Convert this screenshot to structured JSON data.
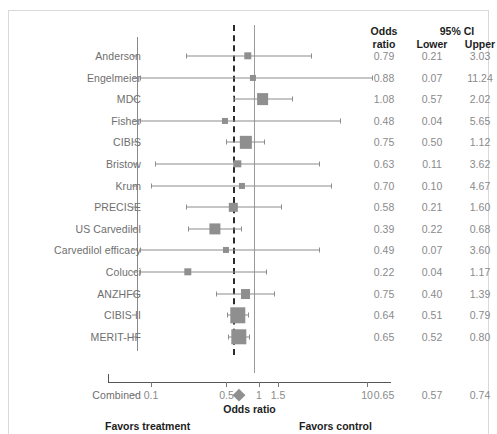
{
  "top_clipped_text": "",
  "table_headers": {
    "odds_ratio": "Odds\nratio",
    "or_line1": "Odds",
    "or_line2": "ratio",
    "ci_group": "95% CI",
    "lower": "Lower",
    "upper": "Upper"
  },
  "axis": {
    "title": "Odds ratio",
    "favors_left": "Favors treatment",
    "favors_right": "Favors control",
    "ticks": [
      0.1,
      0.5,
      1,
      1.5,
      10
    ],
    "tick_labels": [
      "0.1",
      "0.5",
      "1",
      "1.5",
      "10"
    ],
    "scale": "log",
    "xlim": [
      0.07,
      13.5
    ],
    "null_value": 1
  },
  "colors": {
    "marker": "#8f8f8f",
    "ci_line": "#8c8c8c",
    "summary_dashed": "#2b2b2b",
    "null_line": "#9a9a9a",
    "text": "#6e6e6e",
    "header_text": "#1d1d1d",
    "frame": "#d9d9d9"
  },
  "chart_data": {
    "type": "forest",
    "title": "",
    "xlabel": "Odds ratio",
    "ylabel": "",
    "xscale": "log",
    "xlim": [
      0.07,
      13.5
    ],
    "null_line": 1,
    "summary_line": 0.65,
    "grid": false,
    "columns": [
      "Odds ratio",
      "Lower",
      "Upper"
    ],
    "studies": [
      {
        "label": "Anderson",
        "or": 0.79,
        "lower": 0.21,
        "upper": 3.03,
        "weight": 2
      },
      {
        "label": "Engelmeier",
        "or": 0.88,
        "lower": 0.07,
        "upper": 11.24,
        "weight": 1
      },
      {
        "label": "MDC",
        "or": 1.08,
        "lower": 0.57,
        "upper": 2.02,
        "weight": 8
      },
      {
        "label": "Fisher",
        "or": 0.48,
        "lower": 0.04,
        "upper": 5.65,
        "weight": 1
      },
      {
        "label": "CIBIS",
        "or": 0.75,
        "lower": 0.5,
        "upper": 1.12,
        "weight": 9
      },
      {
        "label": "Bristow",
        "or": 0.63,
        "lower": 0.11,
        "upper": 3.62,
        "weight": 2
      },
      {
        "label": "Krum",
        "or": 0.7,
        "lower": 0.1,
        "upper": 4.67,
        "weight": 1
      },
      {
        "label": "PRECISE",
        "or": 0.58,
        "lower": 0.21,
        "upper": 1.6,
        "weight": 3
      },
      {
        "label": "US Carvedilol",
        "or": 0.39,
        "lower": 0.22,
        "upper": 0.68,
        "weight": 7
      },
      {
        "label": "Carvedilol efficacy",
        "or": 0.49,
        "lower": 0.07,
        "upper": 3.6,
        "weight": 1
      },
      {
        "label": "Colucci",
        "or": 0.22,
        "lower": 0.04,
        "upper": 1.17,
        "weight": 2
      },
      {
        "label": "ANZHFG",
        "or": 0.75,
        "lower": 0.4,
        "upper": 1.39,
        "weight": 5
      },
      {
        "label": "CIBIS II",
        "or": 0.64,
        "lower": 0.51,
        "upper": 0.79,
        "weight": 16
      },
      {
        "label": "MERIT-HF",
        "or": 0.65,
        "lower": 0.52,
        "upper": 0.8,
        "weight": 16
      }
    ],
    "combined": {
      "label": "Combined",
      "or": 0.65,
      "lower": 0.57,
      "upper": 0.74
    }
  }
}
